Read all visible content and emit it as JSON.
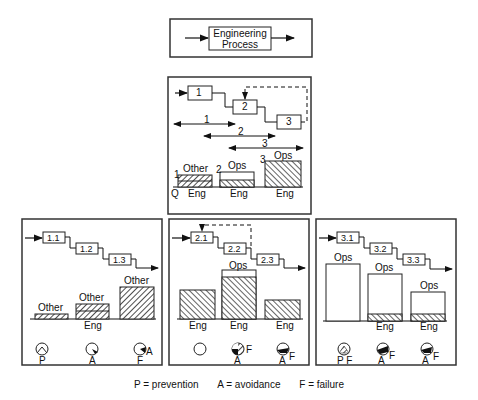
{
  "top_box": {
    "line1": "Engineering",
    "line2": "Process"
  },
  "overview": {
    "steps": [
      "1",
      "2",
      "3"
    ],
    "ranges": [
      "1",
      "2",
      "3"
    ],
    "bars": [
      {
        "num": "1",
        "top_label": "Other",
        "bottom_label": "Eng",
        "axis_label": "Q"
      },
      {
        "num": "2",
        "top_label": "Ops",
        "bottom_label": "Eng"
      },
      {
        "num": "3",
        "top_label": "Ops",
        "bottom_label": "Eng"
      }
    ]
  },
  "panels": [
    {
      "steps": [
        "1.1",
        "1.2",
        "1.3"
      ],
      "bar_top_labels": [
        "Other",
        "Other",
        "Other"
      ],
      "axis_label": "Eng",
      "pie_labels": [
        [
          "P"
        ],
        [
          "A"
        ],
        [
          "F",
          "A"
        ]
      ]
    },
    {
      "steps": [
        "2.1",
        "2.2",
        "2.3"
      ],
      "bar_top_labels": [
        "",
        "Ops",
        ""
      ],
      "bar_bottom_labels": [
        "Eng",
        "Eng",
        "Eng"
      ],
      "pie_labels": [
        [],
        [
          "A",
          "F"
        ],
        [
          "A",
          "F"
        ]
      ]
    },
    {
      "steps": [
        "3.1",
        "3.2",
        "3.3"
      ],
      "bar_top_labels": [
        "Ops",
        "Ops",
        "Ops"
      ],
      "bar_bottom_labels": [
        "",
        "Eng",
        "Eng"
      ],
      "pie_labels": [
        [
          "P F"
        ],
        [
          "A",
          "F"
        ],
        [
          "A",
          "F"
        ]
      ]
    }
  ],
  "legend": {
    "p": "P = prevention",
    "a": "A = avoidance",
    "f": "F = failure"
  }
}
